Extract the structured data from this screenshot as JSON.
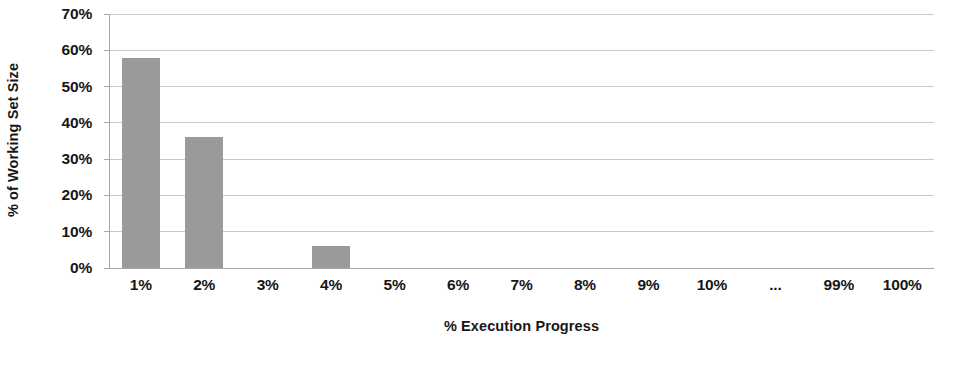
{
  "chart_data": {
    "type": "bar",
    "title": "",
    "subtitle": "",
    "xlabel": "% Execution Progress",
    "ylabel": "% of Working Set Size",
    "categories": [
      "1%",
      "2%",
      "3%",
      "4%",
      "5%",
      "6%",
      "7%",
      "8%",
      "9%",
      "10%",
      "...",
      "99%",
      "100%"
    ],
    "values": [
      58,
      36,
      0,
      6,
      0,
      0,
      0,
      0,
      0,
      0,
      0,
      0,
      0
    ],
    "series": [
      {
        "name": "% of Working Set Size",
        "values": [
          58,
          36,
          0,
          6,
          0,
          0,
          0,
          0,
          0,
          0,
          0,
          0,
          0
        ]
      }
    ],
    "ylim": [
      0,
      70
    ],
    "ytick_values": [
      0,
      10,
      20,
      30,
      40,
      50,
      60,
      70
    ],
    "ytick_labels": [
      "0%",
      "10%",
      "20%",
      "30%",
      "40%",
      "50%",
      "60%",
      "70%"
    ],
    "grid": true,
    "grid_axis": "y",
    "legend": false,
    "legend_position": "none",
    "annotations": [],
    "colors": {
      "bar_fill": "#9a9a9a",
      "gridline": "#c8c8c8",
      "axis_line": "#a8a8a8",
      "text": "#161616",
      "background": "#ffffff"
    }
  }
}
